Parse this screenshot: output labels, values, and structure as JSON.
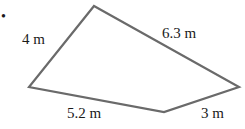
{
  "figure": {
    "type": "quadrilateral",
    "stroke_color": "#6a6a6a",
    "label_color": "#1a1a1a",
    "marker": "•",
    "vertices": {
      "top": [
        94,
        6
      ],
      "left": [
        29,
        87
      ],
      "bottom": [
        164,
        112
      ],
      "right": [
        239,
        87
      ]
    },
    "sides": [
      {
        "name": "top-left side",
        "label": "4 m"
      },
      {
        "name": "top-right side",
        "label": "6.3 m"
      },
      {
        "name": "bottom-left side",
        "label": "5.2 m"
      },
      {
        "name": "bottom-right side",
        "label": "3 m"
      }
    ]
  }
}
